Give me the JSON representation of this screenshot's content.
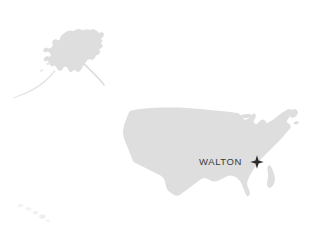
{
  "map": {
    "type": "locator-map",
    "region": "United States",
    "background_color": "#ffffff",
    "land_color": "#dedede",
    "land_color_faint": "#f0f0f0",
    "marker": {
      "label": "WALTON",
      "icon": "four-point-star-marker",
      "color": "#2b2b2b",
      "x": 257,
      "y": 162,
      "size": 13
    },
    "label_color": "#3a3a3a",
    "areas": [
      {
        "name": "alaska",
        "label": "Alaska"
      },
      {
        "name": "contiguous-us",
        "label": "Contiguous United States"
      },
      {
        "name": "hawaii",
        "label": "Hawaii"
      },
      {
        "name": "aleutian-islands",
        "label": "Aleutian Islands"
      }
    ]
  }
}
